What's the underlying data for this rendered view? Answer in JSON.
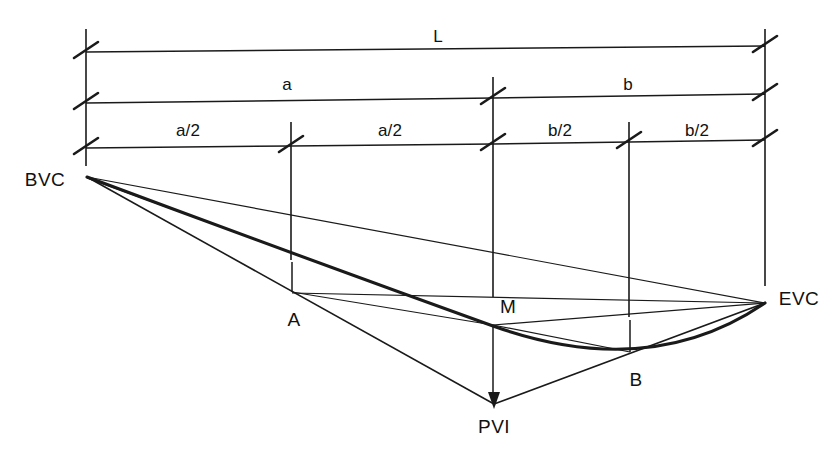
{
  "figure": {
    "kind": "vertical-curve-geometry-diagram",
    "background_color": "#ffffff",
    "line_color": "#1a1a1a",
    "width": 836,
    "height": 453
  },
  "dimensions": {
    "total": {
      "label": "L",
      "x": 438,
      "y": 37
    },
    "halves": [
      {
        "label": "a",
        "x": 287,
        "y": 85
      },
      {
        "label": "b",
        "x": 628,
        "y": 85
      }
    ],
    "quarters": [
      {
        "label": "a/2",
        "x": 188,
        "y": 131
      },
      {
        "label": "a/2",
        "x": 390,
        "y": 131
      },
      {
        "label": "b/2",
        "x": 560,
        "y": 131
      },
      {
        "label": "b/2",
        "x": 697,
        "y": 131
      }
    ]
  },
  "points": [
    {
      "label": "BVC",
      "x": 45,
      "y": 180,
      "anchor_x": 86,
      "anchor_y": 176
    },
    {
      "label": "A",
      "x": 294,
      "y": 320,
      "anchor_x": 292,
      "anchor_y": 292
    },
    {
      "label": "M",
      "x": 508,
      "y": 307,
      "anchor_x": 494,
      "anchor_y": 325
    },
    {
      "label": "B",
      "x": 636,
      "y": 380,
      "anchor_x": 630,
      "anchor_y": 352
    },
    {
      "label": "EVC",
      "x": 799,
      "y": 299,
      "anchor_x": 765,
      "anchor_y": 302
    },
    {
      "label": "PVI",
      "x": 494,
      "y": 427,
      "anchor_x": 494,
      "anchor_y": 404
    }
  ],
  "stations": {
    "bvc_x": 86,
    "quarter_a_x": 291,
    "pvi_x": 493,
    "quarter_b_x": 629,
    "evc_x": 765
  },
  "dimension_rows": {
    "row_L_y": 51,
    "row_ab_y": 100,
    "row_quarters_y": 145
  }
}
